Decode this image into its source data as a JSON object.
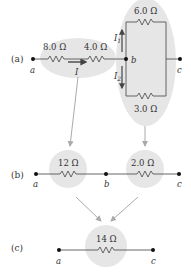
{
  "colors": {
    "wire": "#555555",
    "node": "#111111",
    "highlight": "#e6e6e6",
    "arrow": "#aaaaaa",
    "current_arrow": "#444444"
  },
  "panel_a": {
    "label": "(a)",
    "node_a": "a",
    "node_b": "b",
    "node_c": "c",
    "r1": "8.0 Ω",
    "r2": "4.0 Ω",
    "r3": "6.0 Ω",
    "r4": "3.0 Ω",
    "current_main": "I",
    "current_1": "I",
    "current_1_sub": "1",
    "current_2": "I",
    "current_2_sub": "2"
  },
  "panel_b": {
    "label": "(b)",
    "node_a": "a",
    "node_b": "b",
    "node_c": "c",
    "r_series": "12 Ω",
    "r_parallel": "2.0 Ω"
  },
  "panel_c": {
    "label": "(c)",
    "node_a": "a",
    "node_c": "c",
    "r_eq": "14 Ω"
  }
}
